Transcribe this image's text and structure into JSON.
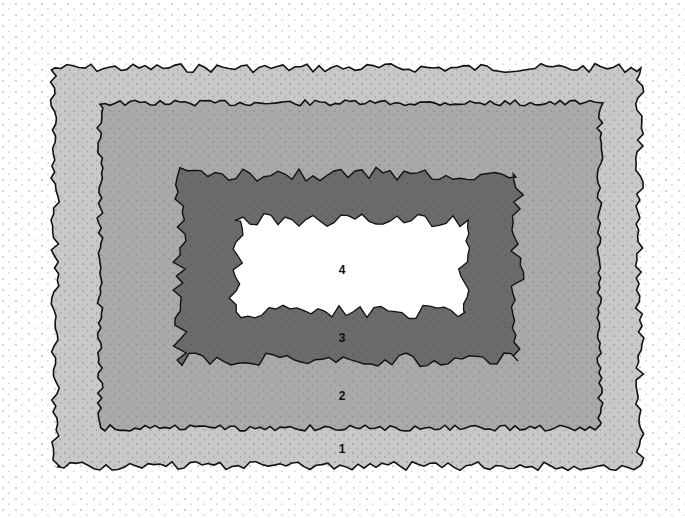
{
  "diagram": {
    "type": "nested-zones",
    "zones": [
      {
        "id": "1",
        "label": "1",
        "color": "#c8c8c8",
        "label_pos": [
          342,
          449
        ]
      },
      {
        "id": "2",
        "label": "2",
        "color": "#a9a9a9",
        "label_pos": [
          342,
          396
        ]
      },
      {
        "id": "3",
        "label": "3",
        "color": "#6b6b6b",
        "label_pos": [
          342,
          338
        ]
      },
      {
        "id": "4",
        "label": "4",
        "color": "#ffffff",
        "label_pos": [
          342,
          270
        ]
      }
    ],
    "outline_color": "#111111",
    "stipple_color": "#222222"
  }
}
